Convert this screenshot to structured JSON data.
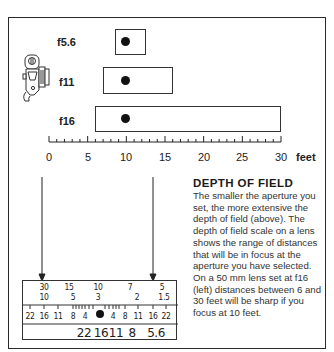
{
  "diagram": {
    "apertures": [
      {
        "label": "f5.6",
        "near_ft": 8.6,
        "far_ft": 12.7,
        "focus_ft": 10
      },
      {
        "label": "f11",
        "near_ft": 7,
        "far_ft": 16,
        "focus_ft": 10
      },
      {
        "label": "f16",
        "near_ft": 6,
        "far_ft": 30,
        "focus_ft": 10
      }
    ],
    "distance_scale": {
      "ticks": [
        "0",
        "5",
        "10",
        "15",
        "20",
        "25",
        "30"
      ],
      "unit": "feet",
      "min": 0,
      "max": 30,
      "minor_step": 1
    },
    "camera_icon": "camera-side-view-icon",
    "text_block": {
      "heading": "DEPTH OF FIELD",
      "body": "The smaller the aperture you set, the more extensive the depth of field (above). The depth of field scale on a lens shows the range of distances that will be in focus at the aperture you have selected. On a 50 mm lens set at f16 (left) distances between 6 and 30 feet will be sharp if you focus at 10 feet."
    },
    "lens_scale": {
      "feet_row": [
        "30",
        "15",
        "10",
        "7",
        "5"
      ],
      "meters_row": [
        "10",
        "5",
        "3",
        "2",
        "1.5"
      ],
      "dof_row_left": [
        "22",
        "16",
        "11",
        "8",
        "4"
      ],
      "dof_row_right": [
        "4",
        "8",
        "11",
        "16",
        "22"
      ],
      "aperture_ring": [
        "22",
        "16",
        "11",
        "8",
        "5.6"
      ]
    }
  }
}
